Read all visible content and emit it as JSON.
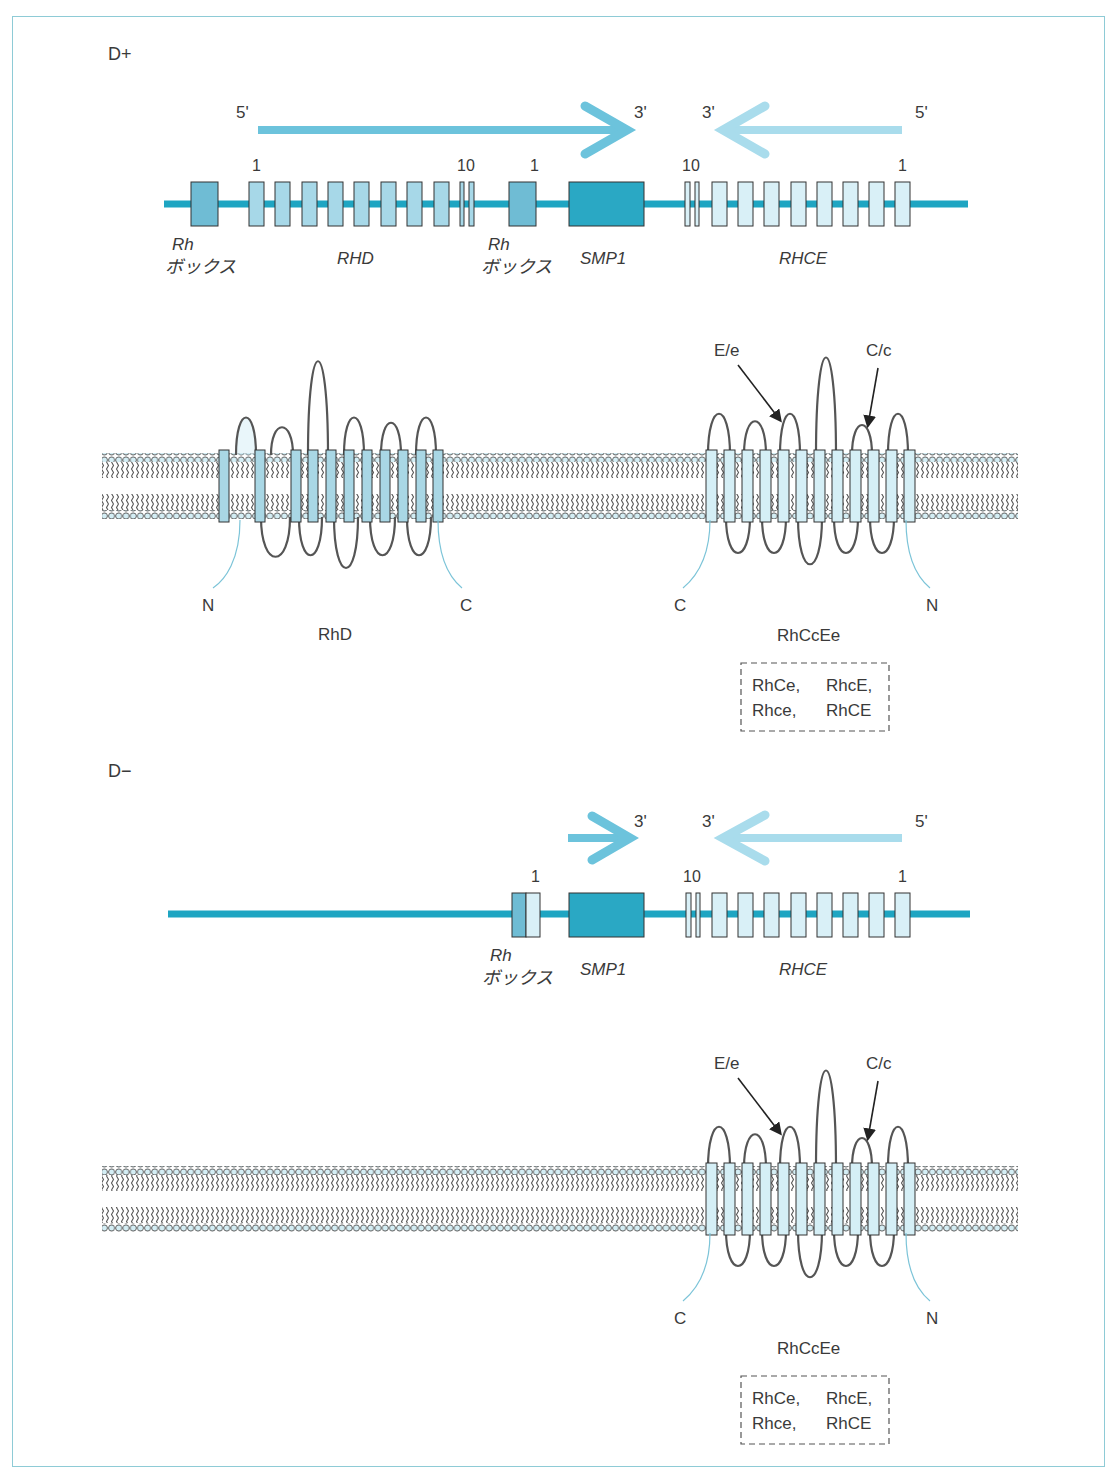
{
  "colors": {
    "frame": "#8ecbd6",
    "dna_line": "#1ea5c2",
    "arrow_rhd": "#6cc3dc",
    "arrow_rhce": "#a9dcec",
    "rh_box": "#6fbcd4",
    "rhd_exon": "#a7d8e8",
    "rhce_exon": "#d9f0f7",
    "smp1": "#2aa8c4",
    "tm_rhd": "#a9d7e5",
    "tm_rhce": "#d5eff6",
    "lipid_head": "#d4eef5",
    "loop_stroke": "#555555"
  },
  "sections": [
    {
      "id": "d-positive",
      "label": "D+",
      "gene_map": {
        "strand_arrows": [
          {
            "from": "5'",
            "to": "3'",
            "direction": "right",
            "gene": "RHD"
          },
          {
            "from": "5'",
            "to": "3'",
            "direction": "left",
            "gene": "RHCE"
          }
        ],
        "prime_labels": [
          "5'",
          "3'",
          "3'",
          "5'"
        ],
        "exon_numbers": {
          "rhd_first": "1",
          "rhd_last": "10",
          "rhce_start": "1",
          "rhce_last": "10",
          "rhce_first": "1"
        },
        "rh_box_line1": "Rh",
        "rh_box_line2": "ボックス",
        "genes": {
          "rhd": "RHD",
          "smp1": "SMP1",
          "rhce": "RHCE"
        }
      },
      "proteins": [
        {
          "name": "RhD",
          "n_term": "N",
          "c_term": "C",
          "tm_segments": 11
        },
        {
          "name": "RhCcEe",
          "n_term": "N",
          "c_term": "C",
          "tm_segments": 12,
          "annotations": [
            "E/e",
            "C/c"
          ],
          "variants": [
            "RhCe,",
            "RhcE,",
            "Rhce,",
            "RhCE"
          ]
        }
      ]
    },
    {
      "id": "d-negative",
      "label": "D−",
      "gene_map": {
        "prime_labels": [
          "3'",
          "3'",
          "5'"
        ],
        "exon_numbers": {
          "hybrid": "1",
          "rhce_last": "10",
          "rhce_first": "1"
        },
        "rh_box_line1": "Rh",
        "rh_box_line2": "ボックス",
        "genes": {
          "smp1": "SMP1",
          "rhce": "RHCE"
        }
      },
      "proteins": [
        {
          "name": "RhCcEe",
          "n_term": "N",
          "c_term": "C",
          "tm_segments": 12,
          "annotations": [
            "E/e",
            "C/c"
          ],
          "variants": [
            "RhCe,",
            "RhcE,",
            "Rhce,",
            "RhCE"
          ]
        }
      ]
    }
  ]
}
